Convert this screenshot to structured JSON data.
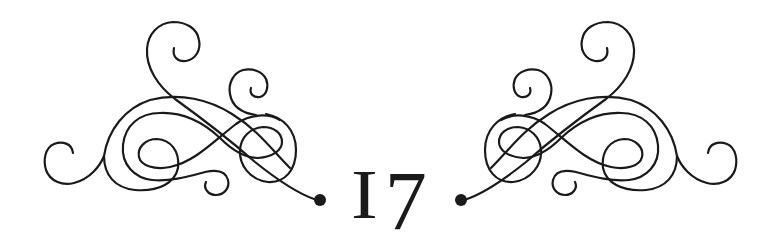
{
  "chapter": {
    "number": "17",
    "digit_one": "I",
    "digit_seven": "7"
  },
  "ornament": {
    "left": "flourish-scroll-left",
    "right": "flourish-scroll-right",
    "stroke_color": "#1a1a1a",
    "background": "#ffffff"
  }
}
